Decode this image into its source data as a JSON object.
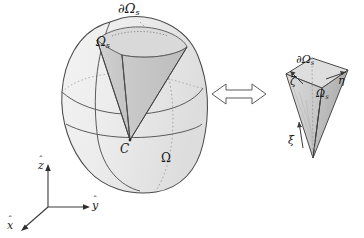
{
  "figure": {
    "background_color": "#ffffff",
    "ink_color": "#1a1a1a",
    "shade_light": "#e4e4e4",
    "shade_mid": "#cfcfcf",
    "shade_dark": "#b9b9b9",
    "hidden_line_color": "#9a9a9a"
  },
  "left_object": {
    "name": "physical-domain",
    "domain_label": "Ω",
    "center_label": "C",
    "sector_label": "Ω",
    "sector_sub": "s",
    "surface_label": "∂Ω",
    "surface_sub": "s"
  },
  "right_object": {
    "name": "reference-pyramid",
    "surface_label": "∂Ω",
    "surface_sub": "s",
    "sector_label": "Ω",
    "sector_sub": "s",
    "axis_xi": "ξ",
    "axis_eta": "η",
    "axis_zeta": "ζ"
  },
  "mapping_arrow": {
    "name": "bidirectional-mapping-arrow",
    "glyph": "⟺",
    "direction": "both"
  },
  "axes_triad": {
    "x_label": "x",
    "y_label": "y",
    "z_label": "z",
    "hat_glyph": "ˆ"
  }
}
